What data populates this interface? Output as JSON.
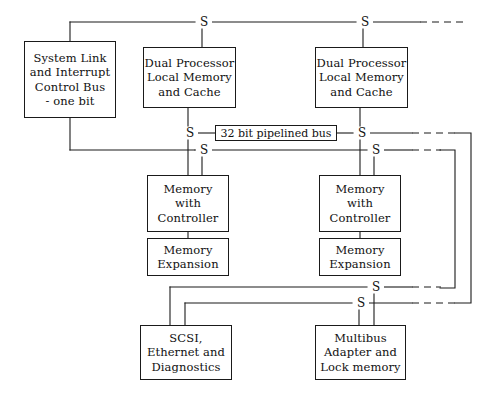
{
  "diagram": {
    "stroke_color": "#1a1a1a",
    "background_color": "#ffffff",
    "canvas": {
      "width": 498,
      "height": 400
    },
    "bus_junction_symbol": "S",
    "nodes": [
      {
        "id": "system-link",
        "name": "system-link-and-interrupt-control-bus-box",
        "lines": [
          "System Link",
          "and Interrupt",
          "Control Bus",
          "- one bit"
        ],
        "x": 24,
        "y": 41,
        "w": 92,
        "h": 77
      },
      {
        "id": "dual-processor-left",
        "name": "dual-processor-local-memory-and-cache-box-left",
        "lines": [
          "Dual Processor",
          "Local Memory",
          "and Cache"
        ],
        "x": 143,
        "y": 47,
        "w": 93,
        "h": 61
      },
      {
        "id": "dual-processor-right",
        "name": "dual-processor-local-memory-and-cache-box-right",
        "lines": [
          "Dual Processor",
          "Local Memory",
          "and Cache"
        ],
        "x": 315,
        "y": 47,
        "w": 93,
        "h": 61
      },
      {
        "id": "memory-controller-left",
        "name": "memory-with-controller-box-left",
        "lines": [
          "Memory",
          "with",
          "Controller"
        ],
        "x": 147,
        "y": 175,
        "w": 82,
        "h": 57
      },
      {
        "id": "memory-controller-right",
        "name": "memory-with-controller-box-right",
        "lines": [
          "Memory",
          "with",
          "Controller"
        ],
        "x": 319,
        "y": 175,
        "w": 82,
        "h": 57
      },
      {
        "id": "memory-expansion-left",
        "name": "memory-expansion-box-left",
        "lines": [
          "Memory",
          "Expansion"
        ],
        "x": 147,
        "y": 238,
        "w": 82,
        "h": 38
      },
      {
        "id": "memory-expansion-right",
        "name": "memory-expansion-box-right",
        "lines": [
          "Memory",
          "Expansion"
        ],
        "x": 319,
        "y": 238,
        "w": 82,
        "h": 38
      },
      {
        "id": "scsi",
        "name": "scsi-ethernet-and-diagnostics-box",
        "lines": [
          "SCSI,",
          "Ethernet and",
          "Diagnostics"
        ],
        "x": 140,
        "y": 325,
        "w": 92,
        "h": 55
      },
      {
        "id": "multibus",
        "name": "multibus-adapter-and-lock-memory-box",
        "lines": [
          "Multibus",
          "Adapter and",
          "Lock memory"
        ],
        "x": 315,
        "y": 325,
        "w": 91,
        "h": 55
      }
    ],
    "bus_label": {
      "id": "pipelined-bus-label",
      "name": "32-bit-pipelined-bus-label",
      "text": "32 bit pipelined bus",
      "x": 215,
      "y": 125,
      "w": 122,
      "h": 16
    },
    "junctions": [
      {
        "id": "s-top-left",
        "name": "bus-junction-s-top-left",
        "label": "S",
        "x": 202,
        "y": 22
      },
      {
        "id": "s-top-right",
        "name": "bus-junction-s-top-right",
        "label": "S",
        "x": 363,
        "y": 22
      },
      {
        "id": "s-mid-left",
        "name": "bus-junction-s-pipelined-left",
        "label": "S",
        "x": 188,
        "y": 133
      },
      {
        "id": "s-mid-right",
        "name": "bus-junction-s-pipelined-right",
        "label": "S",
        "x": 360,
        "y": 133
      },
      {
        "id": "s-low-left",
        "name": "bus-junction-s-memory-left",
        "label": "S",
        "x": 202,
        "y": 150
      },
      {
        "id": "s-low-right",
        "name": "bus-junction-s-memory-right",
        "label": "S",
        "x": 374,
        "y": 150
      },
      {
        "id": "s-bottom-upper",
        "name": "bus-junction-s-io-upper",
        "label": "S",
        "x": 374,
        "y": 287
      },
      {
        "id": "s-bottom-lower",
        "name": "bus-junction-s-io-lower",
        "label": "S",
        "x": 359,
        "y": 303
      }
    ],
    "solid_wires": [
      {
        "name": "top-bus-horizontal-main",
        "d": "M 70 22 L 195 22"
      },
      {
        "name": "top-bus-horizontal-middle",
        "d": "M 210 22 L 356 22"
      },
      {
        "name": "top-bus-horizontal-right",
        "d": "M 371 22 L 420 22"
      },
      {
        "name": "top-bus-drop-to-system-link",
        "d": "M 70 22 L 70 41"
      },
      {
        "name": "top-bus-drop-to-dual-processor-left",
        "d": "M 202 29 L 202 47"
      },
      {
        "name": "top-bus-drop-to-dual-processor-right",
        "d": "M 363 29 L 363 47"
      },
      {
        "name": "system-link-down-riser",
        "d": "M 70 118 L 70 150"
      },
      {
        "name": "system-link-to-memory-bus",
        "d": "M 70 150 L 195 150"
      },
      {
        "name": "dual-processor-left-to-pipelined-s",
        "d": "M 188 108 L 188 126"
      },
      {
        "name": "dual-processor-right-to-pipelined-s",
        "d": "M 360 108 L 360 126"
      },
      {
        "name": "pipelined-s-left-to-label",
        "d": "M 196 133 L 215 133"
      },
      {
        "name": "pipelined-s-right-from-label",
        "d": "M 337 133 L 353 133"
      },
      {
        "name": "pipelined-bus-right-solid",
        "d": "M 368 133 L 412 133"
      },
      {
        "name": "memory-bus-left-to-s",
        "d": "M 195 150 L 195 150"
      },
      {
        "name": "memory-bus-horizontal",
        "d": "M 210 150 L 367 150"
      },
      {
        "name": "memory-bus-right-solid",
        "d": "M 382 150 L 412 150"
      },
      {
        "name": "memory-bus-drop-left-a",
        "d": "M 202 157 L 202 175"
      },
      {
        "name": "memory-bus-drop-left-b",
        "d": "M 188 140 L 188 175"
      },
      {
        "name": "memory-bus-drop-right-a",
        "d": "M 374 157 L 374 175"
      },
      {
        "name": "memory-bus-drop-right-b",
        "d": "M 360 140 L 360 175"
      },
      {
        "name": "memory-controller-to-expansion-left",
        "d": "M 188 232 L 188 238"
      },
      {
        "name": "memory-controller-to-expansion-right",
        "d": "M 360 232 L 360 238"
      },
      {
        "name": "io-bus-upper-horizontal",
        "d": "M 170 287 L 367 287"
      },
      {
        "name": "io-bus-lower-horizontal",
        "d": "M 185 303 L 352 303"
      },
      {
        "name": "io-bus-upper-left-riser",
        "d": "M 170 287 L 170 325"
      },
      {
        "name": "io-bus-lower-left-riser",
        "d": "M 185 303 L 185 325"
      },
      {
        "name": "io-bus-upper-to-multibus",
        "d": "M 374 294 L 374 325"
      },
      {
        "name": "io-bus-lower-to-multibus",
        "d": "M 359 310 L 359 325"
      },
      {
        "name": "io-bus-upper-right-solid",
        "d": "M 382 287 L 412 287"
      },
      {
        "name": "io-bus-lower-right-solid",
        "d": "M 367 303 L 412 303"
      },
      {
        "name": "outer-right-return-top",
        "d": "M 455 133 L 471 133 L 471 303 L 455 303"
      },
      {
        "name": "inner-right-return",
        "d": "M 440 150 L 455 150 L 455 288 L 440 288"
      }
    ],
    "dashed_wires": [
      {
        "name": "top-bus-dashed-tail",
        "d": "M 420 22 L 463 22"
      },
      {
        "name": "pipelined-bus-dashed-right",
        "d": "M 412 133 L 456 133"
      },
      {
        "name": "memory-bus-dashed-right",
        "d": "M 412 150 L 441 150"
      },
      {
        "name": "io-bus-upper-dashed-right",
        "d": "M 412 287 L 441 287"
      },
      {
        "name": "io-bus-lower-dashed-right",
        "d": "M 412 303 L 456 303"
      }
    ]
  }
}
